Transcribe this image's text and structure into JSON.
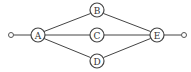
{
  "diagram": {
    "type": "network-graph",
    "nodes": [
      {
        "id": "A",
        "label": "A",
        "x": 38,
        "y": 35
      },
      {
        "id": "B",
        "label": "B",
        "x": 97,
        "y": 10
      },
      {
        "id": "C",
        "label": "C",
        "x": 97,
        "y": 35
      },
      {
        "id": "D",
        "label": "D",
        "x": 97,
        "y": 61
      },
      {
        "id": "E",
        "label": "E",
        "x": 157,
        "y": 35
      }
    ],
    "terminals": [
      {
        "id": "input",
        "x": 11,
        "y": 35
      },
      {
        "id": "output",
        "x": 184,
        "y": 35
      }
    ],
    "edges": [
      {
        "from": "input",
        "to": "A"
      },
      {
        "from": "A",
        "to": "B"
      },
      {
        "from": "A",
        "to": "C"
      },
      {
        "from": "A",
        "to": "D"
      },
      {
        "from": "B",
        "to": "E"
      },
      {
        "from": "C",
        "to": "E"
      },
      {
        "from": "D",
        "to": "E"
      },
      {
        "from": "E",
        "to": "output"
      }
    ]
  }
}
